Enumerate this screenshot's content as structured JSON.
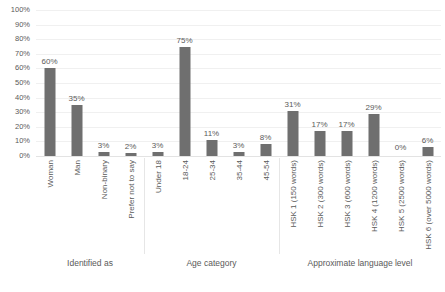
{
  "chart_data": {
    "type": "bar",
    "title": "",
    "subtitle": "",
    "xlabel": "",
    "ylabel": "",
    "ylim": [
      0,
      100
    ],
    "grid": true,
    "legend": "none",
    "orientation": "vertical",
    "value_suffix": "%",
    "bar_color": "#6f6f6f",
    "gridline_color": "#f0f0f0",
    "text_color": "#5a5a5a",
    "y_ticks": [
      "0%",
      "10%",
      "20%",
      "30%",
      "40%",
      "50%",
      "60%",
      "70%",
      "80%",
      "90%",
      "100%"
    ],
    "y_tick_values": [
      0,
      10,
      20,
      30,
      40,
      50,
      60,
      70,
      80,
      90,
      100
    ],
    "categories": [
      "Woman",
      "Man",
      "Non-binary",
      "Prefer not to say",
      "Under 18",
      "18-24",
      "25-34",
      "35-44",
      "45-54",
      "HSK 1 (150 words)",
      "HSK 2 (300 words)",
      "HSK 3 (600 words)",
      "HSK 4 (1200 words)",
      "HSK 5 (2500 words)",
      "HSK 6 (over 5000 words)"
    ],
    "values": [
      60,
      35,
      3,
      2,
      3,
      75,
      11,
      3,
      8,
      31,
      17,
      17,
      29,
      0,
      6
    ],
    "data_labels": [
      "60%",
      "35%",
      "3%",
      "2%",
      "3%",
      "75%",
      "11%",
      "3%",
      "8%",
      "31%",
      "17%",
      "17%",
      "29%",
      "0%",
      "6%"
    ],
    "groups": [
      {
        "title": "Identified as",
        "start": 0,
        "end": 3
      },
      {
        "title": "Age category",
        "start": 4,
        "end": 8
      },
      {
        "title": "Approximate language level",
        "start": 9,
        "end": 14
      }
    ]
  }
}
